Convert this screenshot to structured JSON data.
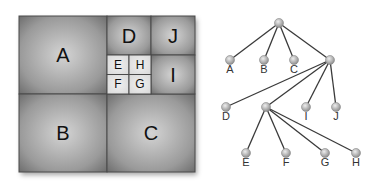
{
  "diagram": {
    "type": "quadtree",
    "colors": {
      "cell_dark": "#7a7a7a",
      "cell_light": "#bdbdbd",
      "small_cell": "#e6e6e6",
      "border": "#4a4a4a",
      "edge": "#3a3a3a",
      "node": "#b0b0b0",
      "text": "#111111"
    },
    "cells": [
      {
        "id": "A",
        "label": "A",
        "x": 19,
        "y": 16,
        "w": 88,
        "h": 78,
        "small": false
      },
      {
        "id": "B",
        "label": "B",
        "x": 19,
        "y": 94,
        "w": 88,
        "h": 78,
        "small": false
      },
      {
        "id": "C",
        "label": "C",
        "x": 107,
        "y": 94,
        "w": 88,
        "h": 78,
        "small": false
      },
      {
        "id": "D",
        "label": "D",
        "x": 107,
        "y": 16,
        "w": 44,
        "h": 39,
        "small": false
      },
      {
        "id": "J",
        "label": "J",
        "x": 151,
        "y": 16,
        "w": 44,
        "h": 39,
        "small": false
      },
      {
        "id": "I",
        "label": "I",
        "x": 151,
        "y": 55,
        "w": 44,
        "h": 39,
        "small": false
      },
      {
        "id": "E",
        "label": "E",
        "x": 107,
        "y": 55,
        "w": 22,
        "h": 19.5,
        "small": true
      },
      {
        "id": "H",
        "label": "H",
        "x": 129,
        "y": 55,
        "w": 22,
        "h": 19.5,
        "small": true
      },
      {
        "id": "F",
        "label": "F",
        "x": 107,
        "y": 74.5,
        "w": 22,
        "h": 19.5,
        "small": true
      },
      {
        "id": "G",
        "label": "G",
        "x": 129,
        "y": 74.5,
        "w": 22,
        "h": 19.5,
        "small": true
      }
    ],
    "tree": {
      "nodes": [
        {
          "id": "root",
          "label": "",
          "x": 279,
          "y": 23
        },
        {
          "id": "A",
          "label": "A",
          "x": 230,
          "y": 60
        },
        {
          "id": "B",
          "label": "B",
          "x": 264,
          "y": 60
        },
        {
          "id": "C",
          "label": "C",
          "x": 294,
          "y": 60
        },
        {
          "id": "q2",
          "label": "",
          "x": 330,
          "y": 60
        },
        {
          "id": "D",
          "label": "D",
          "x": 226,
          "y": 107
        },
        {
          "id": "q3",
          "label": "",
          "x": 266,
          "y": 107
        },
        {
          "id": "I",
          "label": "I",
          "x": 306,
          "y": 107
        },
        {
          "id": "J",
          "label": "J",
          "x": 336,
          "y": 107
        },
        {
          "id": "E",
          "label": "E",
          "x": 246,
          "y": 153
        },
        {
          "id": "F",
          "label": "F",
          "x": 286,
          "y": 153
        },
        {
          "id": "G",
          "label": "G",
          "x": 325,
          "y": 153
        },
        {
          "id": "H",
          "label": "H",
          "x": 356,
          "y": 153
        }
      ],
      "edges": [
        [
          "root",
          "A"
        ],
        [
          "root",
          "B"
        ],
        [
          "root",
          "C"
        ],
        [
          "root",
          "q2"
        ],
        [
          "q2",
          "D"
        ],
        [
          "q2",
          "q3"
        ],
        [
          "q2",
          "I"
        ],
        [
          "q2",
          "J"
        ],
        [
          "q3",
          "E"
        ],
        [
          "q3",
          "F"
        ],
        [
          "q3",
          "G"
        ],
        [
          "q3",
          "H"
        ]
      ]
    }
  }
}
